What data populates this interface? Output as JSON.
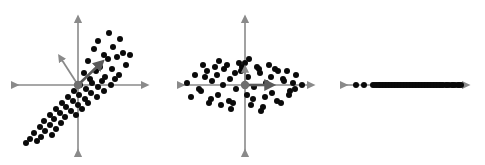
{
  "figure": {
    "title": "",
    "background": "#ffffff",
    "width": 485,
    "height": 165,
    "panel_count": 3
  },
  "colors": {
    "dot": "#0a0a0a",
    "axis": "#8a8a8a",
    "arrow": "#5a5a5a",
    "origin_marker": "#6e6e6e",
    "background": "#ffffff"
  },
  "chart_data": [
    {
      "type": "scatter",
      "name": "panel-1-correlated-data",
      "title": "",
      "xlabel": "",
      "ylabel": "",
      "xlim": [
        -66,
        72
      ],
      "ylim": [
        -68,
        70
      ],
      "grid": false,
      "legend": "none",
      "axes_style": "double-headed-arrow-cross",
      "origin": [
        78,
        85
      ],
      "marker_radius": 3.0,
      "annotations": [
        {
          "name": "principal-component-1-arrow",
          "kind": "arrow",
          "from": [
            0,
            0
          ],
          "to": [
            23,
            22
          ],
          "weight": "thick"
        },
        {
          "name": "principal-component-2-arrow",
          "kind": "arrow",
          "from": [
            0,
            0
          ],
          "to": [
            -18,
            28
          ],
          "weight": "thin"
        }
      ],
      "x": [
        31,
        20,
        42,
        16,
        35,
        26,
        45,
        10,
        30,
        39,
        52,
        22,
        6,
        18,
        34,
        48,
        12,
        27,
        41,
        2,
        14,
        24,
        37,
        -4,
        8,
        20,
        33,
        -10,
        1,
        13,
        26,
        -16,
        -5,
        7,
        19,
        -22,
        -12,
        0,
        10,
        -28,
        -18,
        -7,
        4,
        -34,
        -24,
        -13,
        -2,
        -38,
        -28,
        -17,
        -44,
        -33,
        -22,
        -48,
        -37,
        -26,
        -52,
        -41
      ],
      "y": [
        52,
        44,
        46,
        36,
        38,
        30,
        32,
        24,
        26,
        28,
        30,
        18,
        12,
        14,
        16,
        20,
        6,
        8,
        10,
        0,
        2,
        4,
        6,
        -6,
        -4,
        -2,
        0,
        -12,
        -10,
        -8,
        -6,
        -18,
        -16,
        -14,
        -12,
        -24,
        -22,
        -20,
        -18,
        -30,
        -28,
        -26,
        -24,
        -36,
        -34,
        -32,
        -30,
        -42,
        -40,
        -38,
        -48,
        -46,
        -44,
        -54,
        -52,
        -50,
        -58,
        -56
      ]
    },
    {
      "type": "scatter",
      "name": "panel-2-rotated-decorrelated-data",
      "title": "",
      "xlabel": "",
      "ylabel": "",
      "xlim": [
        -66,
        68
      ],
      "ylim": [
        -68,
        70
      ],
      "grid": false,
      "legend": "none",
      "axes_style": "double-headed-arrow-cross",
      "origin": [
        83,
        85
      ],
      "marker_radius": 3.0,
      "annotations": [
        {
          "name": "principal-component-1-arrow",
          "kind": "arrow",
          "from": [
            0,
            0
          ],
          "to": [
            26,
            0
          ],
          "weight": "thick"
        },
        {
          "name": "principal-component-2-arrow",
          "kind": "arrow",
          "from": [
            0,
            0
          ],
          "to": [
            0,
            17
          ],
          "weight": "thin"
        }
      ],
      "x": [
        -58,
        -50,
        -44,
        -38,
        -33,
        -27,
        -21,
        -15,
        -9,
        -3,
        3,
        9,
        15,
        21,
        27,
        33,
        39,
        45,
        51,
        57,
        -54,
        -46,
        -40,
        -34,
        -28,
        -22,
        -16,
        -10,
        -4,
        2,
        8,
        14,
        20,
        26,
        32,
        38,
        44,
        50,
        -42,
        -36,
        -30,
        -24,
        -18,
        -12,
        -6,
        0,
        6,
        12,
        18,
        24,
        30,
        36,
        42,
        48,
        -26,
        -14,
        4,
        16
      ],
      "y": [
        2,
        10,
        -6,
        14,
        4,
        -10,
        16,
        6,
        -4,
        18,
        8,
        -2,
        12,
        2,
        -8,
        14,
        4,
        -6,
        10,
        0,
        -12,
        -4,
        8,
        -14,
        10,
        0,
        -16,
        12,
        14,
        -10,
        -14,
        16,
        -12,
        8,
        -16,
        6,
        -10,
        -4,
        20,
        -18,
        18,
        -20,
        20,
        -18,
        22,
        22,
        -20,
        18,
        -22,
        20,
        16,
        -18,
        14,
        2,
        24,
        -24,
        26,
        -26
      ]
    },
    {
      "type": "scatter",
      "name": "panel-3-one-dimensional-projection",
      "title": "",
      "xlabel": "",
      "ylabel": "",
      "xlim": [
        -62,
        62
      ],
      "ylim": [
        0,
        0
      ],
      "grid": false,
      "legend": "none",
      "axes_style": "double-headed-arrow-horizontal",
      "origin": [
        405,
        85
      ],
      "marker_radius": 3.0,
      "annotations": [],
      "x": [
        -50,
        -42,
        -33,
        -29,
        -26,
        -23,
        -20,
        -17,
        -14,
        -11,
        -8,
        -5,
        -2,
        1,
        4,
        7,
        10,
        13,
        16,
        19,
        22,
        25,
        28,
        31,
        34,
        37,
        40,
        43,
        46,
        49,
        52,
        55,
        -31,
        -27,
        -24,
        -21,
        -18,
        -15,
        -12,
        -9,
        -6,
        -3,
        0,
        3,
        6,
        9,
        12,
        15,
        18,
        21,
        24,
        27,
        30,
        33,
        36,
        41,
        47,
        53
      ],
      "y": [
        0,
        0,
        0,
        0,
        0,
        0,
        0,
        0,
        0,
        0,
        0,
        0,
        0,
        0,
        0,
        0,
        0,
        0,
        0,
        0,
        0,
        0,
        0,
        0,
        0,
        0,
        0,
        0,
        0,
        0,
        0,
        0,
        0,
        0,
        0,
        0,
        0,
        0,
        0,
        0,
        0,
        0,
        0,
        0,
        0,
        0,
        0,
        0,
        0,
        0,
        0,
        0,
        0,
        0,
        0,
        0,
        0,
        0
      ]
    }
  ]
}
